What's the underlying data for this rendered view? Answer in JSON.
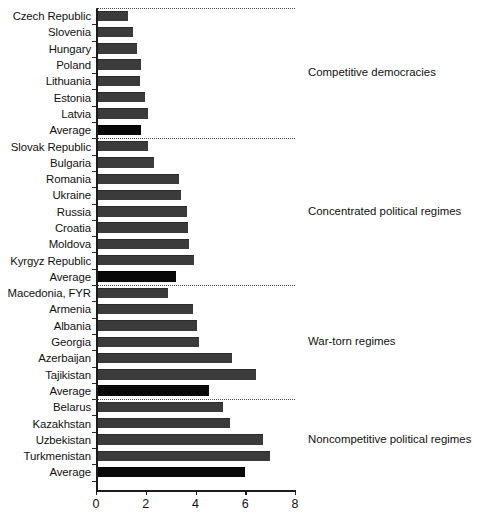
{
  "chart_data": {
    "type": "bar",
    "orientation": "horizontal",
    "title": "",
    "subtitle": "",
    "xlabel": "",
    "ylabel": "",
    "xlim": [
      0,
      8
    ],
    "xticks": [
      0,
      2,
      4,
      6
    ],
    "xtick_labels": [
      "0",
      "2",
      "4",
      "6",
      "8"
    ],
    "xticks_all": [
      0,
      2,
      4,
      6,
      8
    ],
    "grid": false,
    "legend": "none",
    "categories": [
      "Czech Republic",
      "Slovenia",
      "Hungary",
      "Poland",
      "Lithuania",
      "Estonia",
      "Latvia",
      "Average",
      "Slovak Republic",
      "Bulgaria",
      "Romania",
      "Ukraine",
      "Russia",
      "Croatia",
      "Moldova",
      "Kyrgyz Republic",
      "Average",
      "Macedonia, FYR",
      "Armenia",
      "Albania",
      "Georgia",
      "Azerbaijan",
      "Tajikistan",
      "Average",
      "Belarus",
      "Kazakhstan",
      "Uzbekistan",
      "Turkmenistan",
      "Average"
    ],
    "values": [
      1.3,
      1.5,
      1.65,
      1.8,
      1.75,
      1.95,
      2.1,
      1.8,
      2.1,
      2.35,
      3.35,
      3.4,
      3.65,
      3.7,
      3.75,
      3.95,
      3.2,
      2.9,
      3.9,
      4.05,
      4.15,
      5.45,
      6.45,
      4.55,
      5.1,
      5.4,
      6.7,
      7.0,
      6.0
    ],
    "groups": [
      {
        "label": "Competitive democracies",
        "rows": [
          {
            "name": "Czech Republic",
            "value": 1.3,
            "is_average": false
          },
          {
            "name": "Slovenia",
            "value": 1.5,
            "is_average": false
          },
          {
            "name": "Hungary",
            "value": 1.65,
            "is_average": false
          },
          {
            "name": "Poland",
            "value": 1.8,
            "is_average": false
          },
          {
            "name": "Lithuania",
            "value": 1.75,
            "is_average": false
          },
          {
            "name": "Estonia",
            "value": 1.95,
            "is_average": false
          },
          {
            "name": "Latvia",
            "value": 2.1,
            "is_average": false
          },
          {
            "name": "Average",
            "value": 1.8,
            "is_average": true
          }
        ]
      },
      {
        "label": "Concentrated political regimes",
        "rows": [
          {
            "name": "Slovak Republic",
            "value": 2.1,
            "is_average": false
          },
          {
            "name": "Bulgaria",
            "value": 2.35,
            "is_average": false
          },
          {
            "name": "Romania",
            "value": 3.35,
            "is_average": false
          },
          {
            "name": "Ukraine",
            "value": 3.4,
            "is_average": false
          },
          {
            "name": "Russia",
            "value": 3.65,
            "is_average": false
          },
          {
            "name": "Croatia",
            "value": 3.7,
            "is_average": false
          },
          {
            "name": "Moldova",
            "value": 3.75,
            "is_average": false
          },
          {
            "name": "Kyrgyz Republic",
            "value": 3.95,
            "is_average": false
          },
          {
            "name": "Average",
            "value": 3.2,
            "is_average": true
          }
        ]
      },
      {
        "label": "War-torn regimes",
        "rows": [
          {
            "name": "Macedonia, FYR",
            "value": 2.9,
            "is_average": false
          },
          {
            "name": "Armenia",
            "value": 3.9,
            "is_average": false
          },
          {
            "name": "Albania",
            "value": 4.05,
            "is_average": false
          },
          {
            "name": "Georgia",
            "value": 4.15,
            "is_average": false
          },
          {
            "name": "Azerbaijan",
            "value": 5.45,
            "is_average": false
          },
          {
            "name": "Tajikistan",
            "value": 6.45,
            "is_average": false
          },
          {
            "name": "Average",
            "value": 4.55,
            "is_average": true
          }
        ]
      },
      {
        "label": "Noncompetitive political regimes",
        "rows": [
          {
            "name": "Belarus",
            "value": 5.1,
            "is_average": false
          },
          {
            "name": "Kazakhstan",
            "value": 5.4,
            "is_average": false
          },
          {
            "name": "Uzbekistan",
            "value": 6.7,
            "is_average": false
          },
          {
            "name": "Turkmenistan",
            "value": 7.0,
            "is_average": false
          },
          {
            "name": "Average",
            "value": 6.0,
            "is_average": true
          }
        ]
      }
    ],
    "colors": {
      "bar": "#3b3b3b",
      "average_bar": "#090909",
      "axis": "#1b1b1b",
      "separator": "#4a4a4a",
      "background": "#ffffff"
    }
  }
}
